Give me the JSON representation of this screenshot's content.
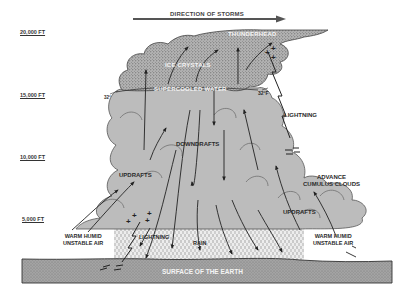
{
  "colors": {
    "background": "#ffffff",
    "cloud_upper": "#a9a9a9",
    "cloud_lower": "#bdbdbd",
    "cloud_outline": "#555555",
    "ground": "#9a9a9a",
    "rain_area": "#e4e4e4",
    "ink": "#2a2a2a"
  },
  "direction": {
    "label": "DIRECTION OF STORMS"
  },
  "altitudes": [
    {
      "label": "20,000 FT"
    },
    {
      "label": "15,000 FT"
    },
    {
      "label": "10,000 FT"
    },
    {
      "label": "5,000 FT"
    }
  ],
  "labels": {
    "thunderhead": "THUNDERHEAD",
    "ice_crystals": "ICE CRYSTALS",
    "supercooled_water": "SUPERCOOLED WATER",
    "freezing_left": "32°",
    "freezing_right": "32°F",
    "lightning_upper": "LIGHTNING",
    "downdrafts": "DOWNDRAFTS",
    "updrafts_left": "UPDRAFTS",
    "advance_line1": "ADVANCE",
    "advance_line2": "CUMULUS CLOUDS",
    "updrafts_right": "UPDRAFTS",
    "warm_left_line1": "WARM HUMID",
    "warm_left_line2": "UNSTABLE AIR",
    "lightning_lower": "LIGHTNING",
    "rain": "RAIN",
    "warm_right_line1": "WARM HUMID",
    "warm_right_line2": "UNSTABLE AIR",
    "surface": "SURFACE OF THE EARTH"
  },
  "charges": {
    "positive": "+",
    "negative": "−"
  }
}
